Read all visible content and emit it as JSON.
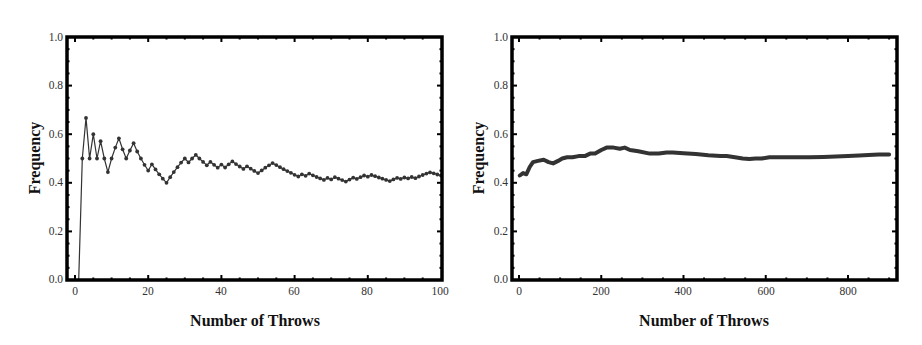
{
  "figure": {
    "panels": [
      {
        "id": "left",
        "xlabel": "Number of Throws",
        "ylabel": "Frequency",
        "xticks": [
          "0",
          "20",
          "40",
          "60",
          "80",
          "100"
        ],
        "yticks": [
          "0.0",
          "0.2",
          "0.4",
          "0.6",
          "0.8",
          "1.0"
        ]
      },
      {
        "id": "right",
        "xlabel": "Number of Throws",
        "ylabel": "Frequency",
        "xticks": [
          "0",
          "200",
          "400",
          "600",
          "800"
        ],
        "yticks": [
          "0.0",
          "0.2",
          "0.4",
          "0.6",
          "0.8",
          "1.0"
        ]
      }
    ],
    "colors": {
      "line": "#333333",
      "frame": "#000000",
      "text": "#333333"
    }
  },
  "chart_data": [
    {
      "type": "line",
      "title": "",
      "xlabel": "Number of Throws",
      "ylabel": "Frequency",
      "xlim": [
        -2,
        102
      ],
      "ylim": [
        0,
        1
      ],
      "xticks": [
        0,
        20,
        40,
        60,
        80,
        100
      ],
      "yticks": [
        0.0,
        0.2,
        0.4,
        0.6,
        0.8,
        1.0
      ],
      "grid": false,
      "markers": true,
      "series": [
        {
          "name": "Frequency",
          "x": [
            1,
            2,
            3,
            4,
            5,
            6,
            7,
            8,
            9,
            10,
            11,
            12,
            13,
            14,
            15,
            16,
            17,
            18,
            19,
            20,
            21,
            22,
            23,
            24,
            25,
            26,
            27,
            28,
            29,
            30,
            31,
            32,
            33,
            34,
            35,
            36,
            37,
            38,
            39,
            40,
            41,
            42,
            43,
            44,
            45,
            46,
            47,
            48,
            49,
            50,
            51,
            52,
            53,
            54,
            55,
            56,
            57,
            58,
            59,
            60,
            61,
            62,
            63,
            64,
            65,
            66,
            67,
            68,
            69,
            70,
            71,
            72,
            73,
            74,
            75,
            76,
            77,
            78,
            79,
            80,
            81,
            82,
            83,
            84,
            85,
            86,
            87,
            88,
            89,
            90,
            91,
            92,
            93,
            94,
            95,
            96,
            97,
            98,
            99,
            100
          ],
          "values": [
            0.0,
            0.5,
            0.667,
            0.5,
            0.6,
            0.5,
            0.571,
            0.5,
            0.444,
            0.5,
            0.545,
            0.583,
            0.538,
            0.5,
            0.533,
            0.563,
            0.529,
            0.5,
            0.474,
            0.45,
            0.476,
            0.455,
            0.435,
            0.417,
            0.4,
            0.423,
            0.444,
            0.464,
            0.483,
            0.5,
            0.484,
            0.5,
            0.515,
            0.5,
            0.486,
            0.472,
            0.486,
            0.474,
            0.462,
            0.475,
            0.463,
            0.476,
            0.488,
            0.477,
            0.467,
            0.457,
            0.468,
            0.458,
            0.449,
            0.44,
            0.451,
            0.462,
            0.472,
            0.481,
            0.473,
            0.464,
            0.456,
            0.448,
            0.441,
            0.433,
            0.426,
            0.435,
            0.429,
            0.438,
            0.431,
            0.424,
            0.418,
            0.412,
            0.42,
            0.414,
            0.423,
            0.417,
            0.411,
            0.405,
            0.413,
            0.421,
            0.416,
            0.423,
            0.43,
            0.425,
            0.432,
            0.427,
            0.422,
            0.417,
            0.412,
            0.407,
            0.414,
            0.42,
            0.416,
            0.422,
            0.418,
            0.424,
            0.419,
            0.426,
            0.432,
            0.438,
            0.443,
            0.439,
            0.434,
            0.43
          ]
        }
      ]
    },
    {
      "type": "line",
      "title": "",
      "xlabel": "Number of Throws",
      "ylabel": "Frequency",
      "xlim": [
        -18,
        918
      ],
      "ylim": [
        0,
        1
      ],
      "xticks": [
        0,
        200,
        400,
        600,
        800
      ],
      "yticks": [
        0.0,
        0.2,
        0.4,
        0.6,
        0.8,
        1.0
      ],
      "grid": false,
      "markers": false,
      "series": [
        {
          "name": "Frequency",
          "x": [
            2,
            10,
            18,
            26,
            34,
            46,
            60,
            72,
            83,
            95,
            105,
            117,
            130,
            145,
            160,
            173,
            185,
            200,
            213,
            230,
            245,
            257,
            270,
            290,
            318,
            340,
            359,
            374,
            400,
            430,
            460,
            490,
            505,
            525,
            544,
            560,
            575,
            590,
            609,
            640,
            670,
            706,
            740,
            770,
            800,
            827,
            850,
            875,
            900
          ],
          "values": [
            0.43,
            0.44,
            0.435,
            0.465,
            0.485,
            0.49,
            0.495,
            0.485,
            0.48,
            0.49,
            0.5,
            0.505,
            0.505,
            0.51,
            0.51,
            0.52,
            0.52,
            0.535,
            0.545,
            0.545,
            0.54,
            0.545,
            0.535,
            0.53,
            0.52,
            0.52,
            0.525,
            0.525,
            0.522,
            0.518,
            0.513,
            0.51,
            0.51,
            0.505,
            0.5,
            0.498,
            0.5,
            0.5,
            0.505,
            0.505,
            0.505,
            0.505,
            0.506,
            0.508,
            0.51,
            0.512,
            0.514,
            0.516,
            0.517
          ]
        }
      ]
    }
  ]
}
